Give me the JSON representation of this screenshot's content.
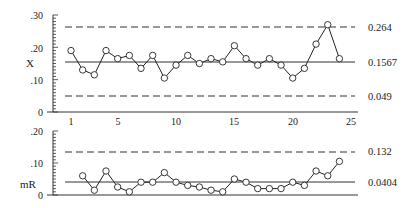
{
  "chart_data": [
    {
      "type": "line",
      "title": "Individuals (X) Chart",
      "xlabel": "",
      "ylabel": "X",
      "ylim": [
        0,
        0.3
      ],
      "yticks": [
        ".30",
        ".20",
        ".10",
        "0"
      ],
      "xticks": [
        "1",
        "5",
        "10",
        "15",
        "20",
        "25"
      ],
      "xlim": [
        1,
        25
      ],
      "x": [
        1,
        2,
        3,
        4,
        5,
        6,
        7,
        8,
        9,
        10,
        11,
        12,
        13,
        14,
        15,
        16,
        17,
        18,
        19,
        20,
        21,
        22,
        23,
        24
      ],
      "values": [
        0.19,
        0.13,
        0.115,
        0.19,
        0.165,
        0.175,
        0.135,
        0.175,
        0.105,
        0.145,
        0.175,
        0.15,
        0.165,
        0.155,
        0.205,
        0.165,
        0.145,
        0.165,
        0.145,
        0.105,
        0.135,
        0.21,
        0.27,
        0.165
      ],
      "control_limits": {
        "ucl": {
          "value": 0.264,
          "label": "0.264",
          "style": "dashed"
        },
        "cl": {
          "value": 0.1567,
          "label": "0.1567",
          "style": "solid"
        },
        "lcl": {
          "value": 0.049,
          "label": "0.049",
          "style": "dashed"
        }
      },
      "grid": false
    },
    {
      "type": "line",
      "title": "Moving Range (mR) Chart",
      "xlabel": "",
      "ylabel": "mR",
      "ylim": [
        0,
        0.2
      ],
      "yticks": [
        ".20",
        ".10",
        "0"
      ],
      "x": [
        2,
        3,
        4,
        5,
        6,
        7,
        8,
        9,
        10,
        11,
        12,
        13,
        14,
        15,
        16,
        17,
        18,
        19,
        20,
        21,
        22,
        23,
        24
      ],
      "values": [
        0.06,
        0.015,
        0.075,
        0.025,
        0.01,
        0.04,
        0.04,
        0.07,
        0.04,
        0.03,
        0.025,
        0.015,
        0.01,
        0.05,
        0.04,
        0.02,
        0.02,
        0.02,
        0.04,
        0.03,
        0.075,
        0.06,
        0.105
      ],
      "control_limits": {
        "ucl": {
          "value": 0.132,
          "label": "0.132",
          "style": "dashed"
        },
        "cl": {
          "value": 0.0404,
          "label": "0.0404",
          "style": "solid"
        }
      },
      "grid": false
    }
  ],
  "labels": {
    "x_chart_ylabel": "X",
    "mr_chart_ylabel": "mR",
    "x_ucl": "0.264",
    "x_cl": "0.1567",
    "x_lcl": "0.049",
    "mr_ucl": "0.132",
    "mr_cl": "0.0404",
    "x_yticks": [
      ".30",
      ".20",
      ".10",
      "0"
    ],
    "mr_yticks": [
      ".20",
      ".10",
      "0"
    ],
    "xticks": [
      "1",
      "5",
      "10",
      "15",
      "20",
      "25"
    ]
  }
}
